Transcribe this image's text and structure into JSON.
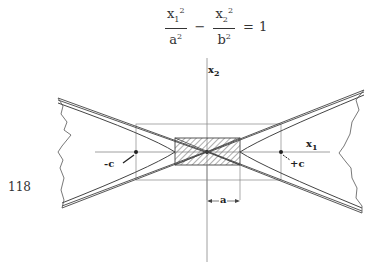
{
  "equation": {
    "term1_num": "x",
    "term1_num_sub": "1",
    "term1_num_sup": "2",
    "term1_den": "a",
    "term1_den_sup": "2",
    "operator": "−",
    "term2_num": "x",
    "term2_num_sub": "2",
    "term2_num_sup": "2",
    "term2_den": "b",
    "term2_den_sup": "2",
    "equals": "=",
    "rhs": "1"
  },
  "page_number": "118",
  "diagram": {
    "axis_x_label": "x",
    "axis_x_sub": "1",
    "axis_y_label": "x",
    "axis_y_sub": "2",
    "focus_left_label": "-c",
    "focus_right_label": "+c",
    "dimension_label": "a",
    "colors": {
      "line": "#444444",
      "axis": "#888888",
      "hatch": "#777777"
    }
  }
}
